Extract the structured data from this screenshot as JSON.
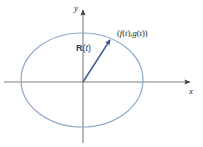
{
  "figure": {
    "background_color": "#ffffff",
    "axes": {
      "x_label": "x",
      "y_label": "y",
      "color": "#7d7d7d",
      "origin": {
        "x": 83,
        "y": 82
      },
      "x_axis": {
        "x_start": 4,
        "x_end": 196,
        "y": 82
      },
      "y_axis": {
        "y_start": 5,
        "y_end": 143,
        "x": 83
      }
    },
    "curve": {
      "name": "ellipse",
      "color": "#8fa8c8",
      "center_x": 82,
      "center_y": 80,
      "radius_x": 61,
      "radius_y": 47,
      "stroke_width": 1.2
    },
    "vector": {
      "label": "R(t)",
      "label_bold_part": "R",
      "label_paren_open": "(",
      "label_italic_part": "t",
      "label_paren_close": ")",
      "color": "#3a5a96",
      "from_x": 83,
      "from_y": 82,
      "to_x": 112,
      "to_y": 38,
      "stroke_width": 1.4
    },
    "point": {
      "label": "(f(t),g(t))",
      "label_x": 118,
      "label_y": 36,
      "parts": {
        "open": "(",
        "f": "f",
        "f_arg_open": "(",
        "f_arg": "t",
        "f_arg_close": ")",
        "comma": ",",
        "g": "g",
        "g_arg_open": "(",
        "g_arg": "t",
        "g_arg_close": ")",
        "close": ")"
      }
    }
  }
}
